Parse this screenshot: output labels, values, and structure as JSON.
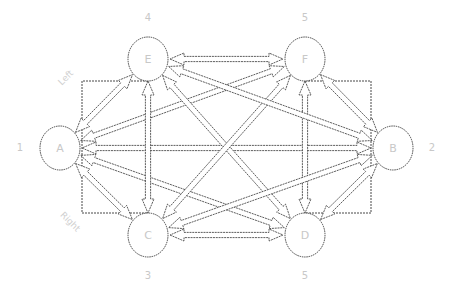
{
  "diagram": {
    "type": "network-graph",
    "nodes": [
      {
        "id": "A",
        "label": "A",
        "number": "1",
        "x": 60,
        "y": 148,
        "r": 22
      },
      {
        "id": "B",
        "label": "B",
        "number": "2",
        "x": 393,
        "y": 148,
        "r": 22
      },
      {
        "id": "C",
        "label": "C",
        "number": "3",
        "x": 148,
        "y": 235,
        "r": 22
      },
      {
        "id": "D",
        "label": "D",
        "number": "5",
        "x": 305,
        "y": 235,
        "r": 22
      },
      {
        "id": "E",
        "label": "E",
        "number": "4",
        "x": 148,
        "y": 59,
        "r": 22
      },
      {
        "id": "F",
        "label": "F",
        "number": "5",
        "x": 305,
        "y": 59,
        "r": 22
      }
    ],
    "side_labels": {
      "left": "Left",
      "right": "Right"
    },
    "edges": [
      {
        "from": "A",
        "to": "B",
        "bidirectional": true
      },
      {
        "from": "A",
        "to": "E",
        "bidirectional": true
      },
      {
        "from": "A",
        "to": "C",
        "bidirectional": true
      },
      {
        "from": "A",
        "to": "F",
        "bidirectional": true
      },
      {
        "from": "A",
        "to": "D",
        "bidirectional": true
      },
      {
        "from": "E",
        "to": "F",
        "bidirectional": true
      },
      {
        "from": "C",
        "to": "D",
        "bidirectional": true
      },
      {
        "from": "E",
        "to": "C",
        "bidirectional": true
      },
      {
        "from": "F",
        "to": "D",
        "bidirectional": true
      },
      {
        "from": "E",
        "to": "D",
        "bidirectional": true
      },
      {
        "from": "F",
        "to": "C",
        "bidirectional": true
      },
      {
        "from": "E",
        "to": "B",
        "bidirectional": true
      },
      {
        "from": "C",
        "to": "B",
        "bidirectional": true
      },
      {
        "from": "F",
        "to": "B",
        "bidirectional": true
      },
      {
        "from": "D",
        "to": "B",
        "bidirectional": true
      }
    ],
    "frames": [
      {
        "name": "left-frame",
        "x1": 82,
        "y1": 81,
        "x2": 148,
        "y2": 213
      },
      {
        "name": "right-frame",
        "x1": 305,
        "y1": 81,
        "x2": 371,
        "y2": 213
      }
    ]
  }
}
